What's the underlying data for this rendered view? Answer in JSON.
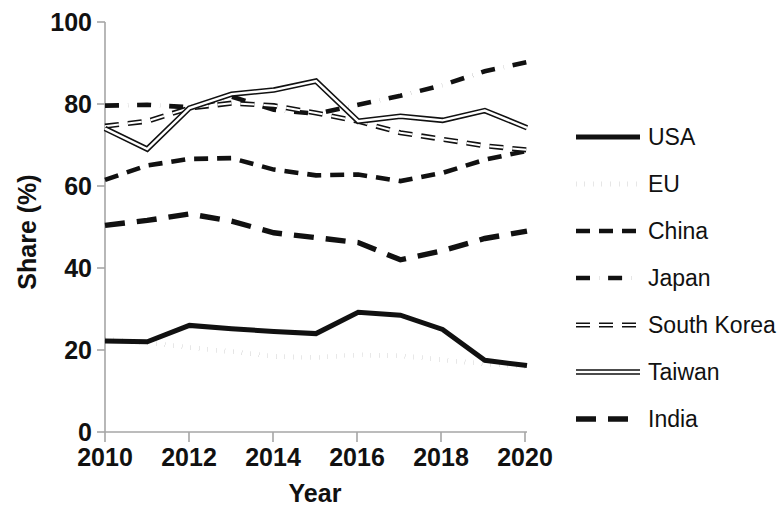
{
  "chart_data": {
    "type": "line",
    "title": "",
    "xlabel": "Year",
    "ylabel": "Share (%)",
    "xlim": [
      2010,
      2020
    ],
    "ylim": [
      0,
      100
    ],
    "xticks": [
      "2010",
      "2012",
      "2014",
      "2016",
      "2018",
      "2020"
    ],
    "yticks": [
      "0",
      "20",
      "40",
      "60",
      "80",
      "100"
    ],
    "grid": false,
    "legend_position": "right",
    "x": [
      2010,
      2011,
      2012,
      2013,
      2014,
      2015,
      2016,
      2017,
      2018,
      2019,
      2020
    ],
    "series": [
      {
        "name": "USA",
        "style": "solid-thick",
        "values": [
          22.2,
          22.0,
          26.0,
          25.2,
          24.5,
          24.0,
          29.2,
          28.5,
          25.0,
          17.5,
          16.2
        ]
      },
      {
        "name": "EU",
        "style": "dotted",
        "values": [
          22.6,
          21.8,
          20.6,
          19.6,
          18.4,
          18.2,
          18.8,
          18.6,
          17.6,
          16.6,
          16.0
        ]
      },
      {
        "name": "China",
        "style": "dashed",
        "values": [
          61.5,
          65.0,
          66.6,
          66.8,
          64.0,
          62.6,
          62.8,
          61.2,
          63.2,
          66.4,
          68.6
        ]
      },
      {
        "name": "Japan",
        "style": "dash-dot",
        "values": [
          79.6,
          79.8,
          79.2,
          81.8,
          78.6,
          77.6,
          79.8,
          82.0,
          84.6,
          88.0,
          90.2
        ]
      },
      {
        "name": "South Korea",
        "style": "dashed-hollow",
        "values": [
          74.6,
          75.8,
          79.0,
          80.2,
          79.6,
          77.8,
          75.8,
          73.0,
          71.4,
          69.8,
          68.8
        ]
      },
      {
        "name": "Taiwan",
        "style": "double-line",
        "values": [
          74.0,
          69.0,
          79.0,
          82.4,
          83.4,
          85.6,
          75.8,
          77.0,
          76.0,
          78.4,
          74.2
        ]
      },
      {
        "name": "India",
        "style": "long-dashed",
        "values": [
          50.4,
          51.6,
          53.2,
          51.4,
          48.6,
          47.4,
          46.2,
          42.0,
          44.2,
          47.2,
          49.0
        ]
      }
    ]
  },
  "axes": {
    "y_title": "Share (%)",
    "x_title": "Year"
  },
  "legend": {
    "items": [
      {
        "label": "USA",
        "style": "solid-thick"
      },
      {
        "label": "EU",
        "style": "dotted"
      },
      {
        "label": "China",
        "style": "dashed"
      },
      {
        "label": "Japan",
        "style": "dash-dot"
      },
      {
        "label": "South Korea",
        "style": "dashed-hollow"
      },
      {
        "label": "Taiwan",
        "style": "double-line"
      },
      {
        "label": "India",
        "style": "long-dashed"
      }
    ]
  },
  "colors": {
    "series": "#111111",
    "axis": "#a6a6a6",
    "background": "#ffffff"
  }
}
